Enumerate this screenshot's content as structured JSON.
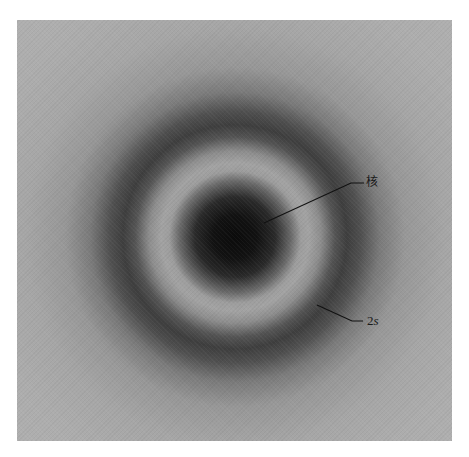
{
  "figure": {
    "labels": {
      "nucleus": "核",
      "orbital_number": "2",
      "orbital_letter": "s"
    },
    "colors": {
      "background": "#b1b1b1",
      "core": "#0b0b0b",
      "nodal_ring": "#a3a3a3",
      "outer_ring": "#3e3e3e",
      "label_text": "#1a1a1a",
      "page": "#ffffff"
    },
    "geometry": {
      "center": [
        235,
        237
      ],
      "core_radius": 40,
      "nodal_ring_radius": 72,
      "outer_ring_radius": 112
    }
  }
}
